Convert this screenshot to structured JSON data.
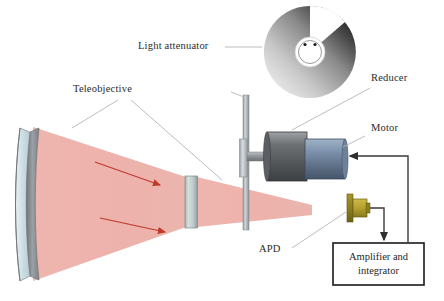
{
  "figure": {
    "background_color": "#ffffff"
  },
  "labels": {
    "light_attenuator": "Light attenuator",
    "teleobjective": "Teleobjective",
    "reducer": "Reducer",
    "motor": "Motor",
    "apd": "APD",
    "amplifier_line1": "Amplifier and",
    "amplifier_line2": "integrator"
  },
  "components": {
    "teleobjective": {
      "name": "Teleobjective",
      "glass_color": "#cfe0e4",
      "rim_color": "#8a8d8e"
    },
    "light_beam": {
      "name": "Light beam cone",
      "color": "#edb2ab",
      "arrow_color": "#c0392b",
      "arrow_count": 2
    },
    "field_lens": {
      "name": "Field lens",
      "color": "#c3cfce"
    },
    "attenuator_disc": {
      "name": "Rotating gradient attenuator disc",
      "edge_color": "#b8bec2",
      "gradient_from": "#ffffff",
      "gradient_to": "#1a1a1a",
      "hub_color": "#ffffff"
    },
    "support_rod": {
      "name": "Support rod",
      "color": "#a8aeb2"
    },
    "reducer": {
      "name": "Reducer gearbox",
      "color": "#6f7376"
    },
    "motor": {
      "name": "Motor",
      "color": "#7d93ae"
    },
    "apd": {
      "name": "Avalanche photodiode detector",
      "color": "#b8a431",
      "flange_color": "#8e7f1f"
    },
    "amplifier_box": {
      "name": "Amplifier and integrator",
      "border_color": "#1a1a1a",
      "fill_color": "#ffffff"
    },
    "wiring": {
      "name": "Signal wiring",
      "color": "#3a3a3a"
    }
  }
}
